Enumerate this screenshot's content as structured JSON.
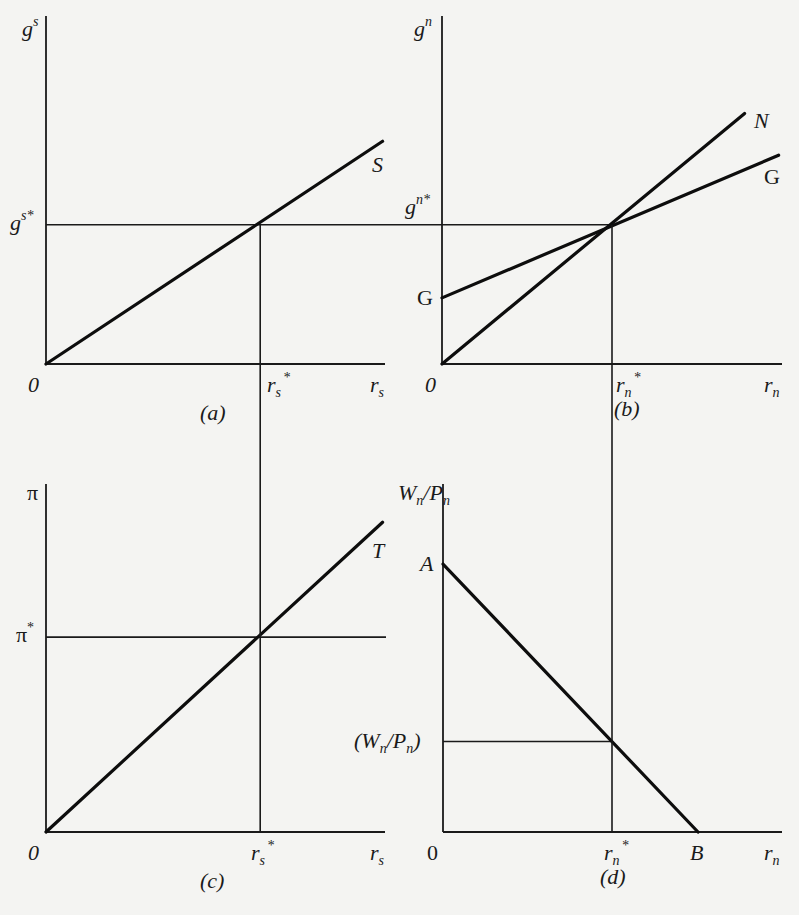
{
  "chart_data": [
    {
      "id": "a",
      "type": "line",
      "caption": "(a)",
      "y_axis_label": {
        "base": "g",
        "sup": "s"
      },
      "x_axis_label": {
        "base": "r",
        "sub": "s"
      },
      "origin_label": "0",
      "equilibrium": {
        "x_label": {
          "base": "r",
          "sub": "s",
          "sup": "*"
        },
        "y_label": {
          "base": "g",
          "sup": "s*"
        },
        "x": 0.63,
        "y": 0.4
      },
      "xlim": [
        0,
        1
      ],
      "ylim": [
        0,
        1
      ],
      "series": [
        {
          "name": "S",
          "label": "S",
          "points": [
            [
              0,
              0
            ],
            [
              0.99,
              0.64
            ]
          ]
        }
      ]
    },
    {
      "id": "b",
      "type": "line",
      "caption": "(b)",
      "y_axis_label": {
        "base": "g",
        "sup": "n"
      },
      "x_axis_label": {
        "base": "r",
        "sub": "n"
      },
      "origin_label": "0",
      "equilibrium": {
        "x_label": {
          "base": "r",
          "sub": "n",
          "sup": "*"
        },
        "y_label": {
          "base": "g",
          "sup": "n*"
        },
        "x": 0.5,
        "y": 0.4
      },
      "xlim": [
        0,
        1
      ],
      "ylim": [
        0,
        1
      ],
      "series": [
        {
          "name": "N",
          "label": "N",
          "points": [
            [
              0,
              0
            ],
            [
              0.89,
              0.72
            ]
          ]
        },
        {
          "name": "G",
          "label": "G",
          "intercept_label": "G",
          "points": [
            [
              0,
              0.19
            ],
            [
              0.99,
              0.6
            ]
          ]
        }
      ]
    },
    {
      "id": "c",
      "type": "line",
      "caption": "(c)",
      "y_axis_label": {
        "base": "π"
      },
      "x_axis_label": {
        "base": "r",
        "sub": "s"
      },
      "origin_label": "0",
      "equilibrium": {
        "x_label": {
          "base": "r",
          "sub": "s",
          "sup": "*"
        },
        "y_label": {
          "base": "π",
          "sup": "*"
        },
        "x": 0.63,
        "y": 0.56
      },
      "xlim": [
        0,
        1
      ],
      "ylim": [
        0,
        1
      ],
      "series": [
        {
          "name": "T",
          "label": "T",
          "points": [
            [
              0,
              0
            ],
            [
              0.99,
              0.89
            ]
          ]
        }
      ]
    },
    {
      "id": "d",
      "type": "line",
      "caption": "(d)",
      "y_axis_label": {
        "base": "W",
        "sub": "n",
        "mid": "/P",
        "sub2": "n"
      },
      "x_axis_label": {
        "base": "r",
        "sub": "n"
      },
      "origin_label": "0",
      "equilibrium": {
        "x_label": {
          "base": "r",
          "sub": "n",
          "sup": "*"
        },
        "y_label": {
          "base": "(W",
          "sub": "n",
          "mid": "/P",
          "sub2": "n",
          "end": ")"
        },
        "x": 0.5,
        "y": 0.26
      },
      "xlim": [
        0,
        1
      ],
      "ylim": [
        0,
        1
      ],
      "series": [
        {
          "name": "AB",
          "start_label": "A",
          "end_label": "B",
          "points": [
            [
              0,
              0.77
            ],
            [
              0.75,
              0
            ]
          ]
        }
      ]
    }
  ]
}
